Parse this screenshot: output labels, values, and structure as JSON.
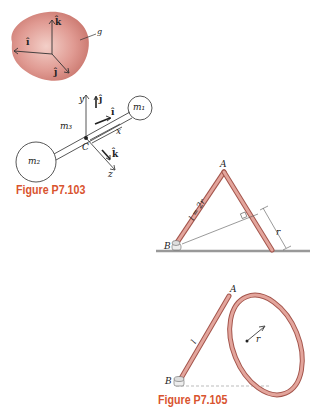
{
  "figure_top": {
    "body_label": "g",
    "unit_vectors": {
      "i": "î",
      "j": "ĵ",
      "k": "k̂"
    }
  },
  "figure_p7_103": {
    "caption": "Figure P7.103",
    "masses": {
      "m1": "m₁",
      "m2": "m₂",
      "m3": "m₃"
    },
    "center_label": "C",
    "axes": {
      "x": "x",
      "y": "y",
      "z": "z"
    },
    "unit_vectors": {
      "i": "î",
      "j": "ĵ",
      "k": "k̂"
    }
  },
  "figure_p7_104": {
    "apex_label": "A",
    "support_label": "B",
    "rod_length_label": "l = 2r",
    "perpendicular_label": "r"
  },
  "figure_p7_105": {
    "caption": "Figure P7.105",
    "apex_label": "A",
    "support_label": "B",
    "rod_length_label": "l",
    "radius_label": "r"
  },
  "colors": {
    "caption": "#d9542f",
    "body_fill": "#d98c84",
    "rod_fill": "#e3a59c",
    "rod_stroke": "#a4554c",
    "ground": "#999999"
  }
}
